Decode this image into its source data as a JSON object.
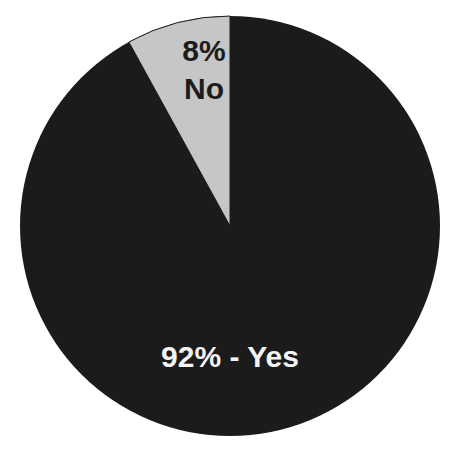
{
  "chart_data": {
    "type": "pie",
    "title": "",
    "slices": [
      {
        "label": "Yes",
        "value": 92,
        "color": "#1b1b1b",
        "display_label": "92% - Yes"
      },
      {
        "label": "No",
        "value": 8,
        "color": "#c6c6c6",
        "display_label_pct": "8%",
        "display_label_name": "No"
      }
    ],
    "start_angle_deg": 0,
    "direction": "counterclockwise-from-top for No slice",
    "legend": "none"
  },
  "labels": {
    "no_pct": "8%",
    "no_name": "No",
    "yes": "92% - Yes"
  }
}
